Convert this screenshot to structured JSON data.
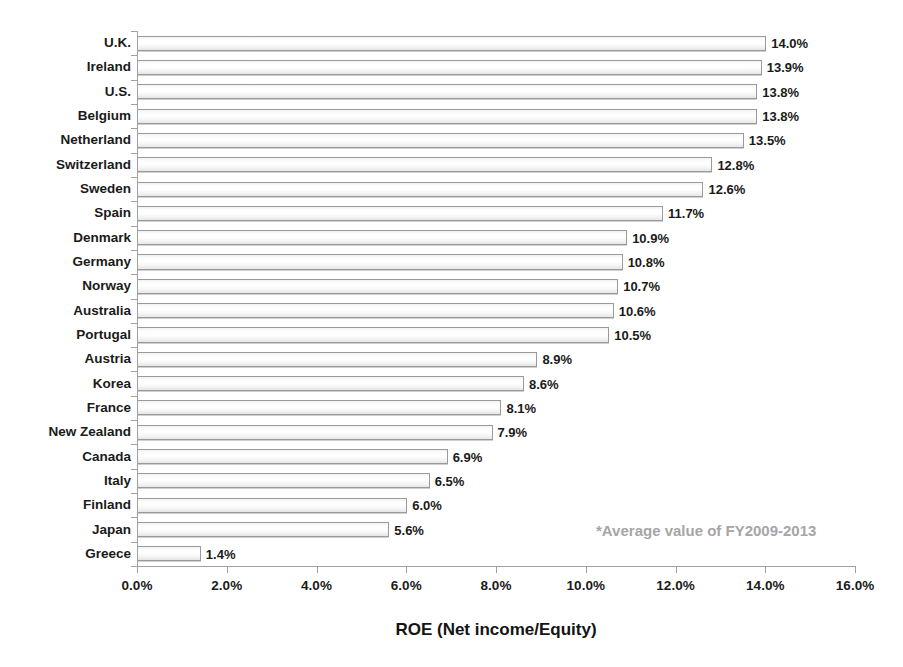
{
  "chart_data": {
    "type": "bar",
    "orientation": "horizontal",
    "title": "",
    "xlabel": "ROE (Net income/Equity)",
    "ylabel": "",
    "xlim": [
      0,
      16
    ],
    "xtick_labels": [
      "0.0%",
      "2.0%",
      "4.0%",
      "6.0%",
      "8.0%",
      "10.0%",
      "12.0%",
      "14.0%",
      "16.0%"
    ],
    "xtick_values": [
      0,
      2,
      4,
      6,
      8,
      10,
      12,
      14,
      16
    ],
    "grid": false,
    "legend": "none",
    "annotation": "*Average value of FY2009-2013",
    "categories": [
      "U.K.",
      "Ireland",
      "U.S.",
      "Belgium",
      "Netherland",
      "Switzerland",
      "Sweden",
      "Spain",
      "Denmark",
      "Germany",
      "Norway",
      "Australia",
      "Portugal",
      "Austria",
      "Korea",
      "France",
      "New Zealand",
      "Canada",
      "Italy",
      "Finland",
      "Japan",
      "Greece"
    ],
    "values": [
      14.0,
      13.9,
      13.8,
      13.8,
      13.5,
      12.8,
      12.6,
      11.7,
      10.9,
      10.8,
      10.7,
      10.6,
      10.5,
      8.9,
      8.6,
      8.1,
      7.9,
      6.9,
      6.5,
      6.0,
      5.6,
      1.4
    ],
    "data_labels": [
      "14.0%",
      "13.9%",
      "13.8%",
      "13.8%",
      "13.5%",
      "12.8%",
      "12.6%",
      "11.7%",
      "10.9%",
      "10.8%",
      "10.7%",
      "10.6%",
      "10.5%",
      "8.9%",
      "8.6%",
      "8.1%",
      "7.9%",
      "6.9%",
      "6.5%",
      "6.0%",
      "5.6%",
      "1.4%"
    ],
    "colors": {
      "bar_fill": "#f4f4f4",
      "bar_border": "#9a9a9a",
      "axis": "#a0a0a0",
      "text": "#1a1a1a",
      "annotation": "#a6a6a6",
      "background": "#ffffff"
    }
  }
}
